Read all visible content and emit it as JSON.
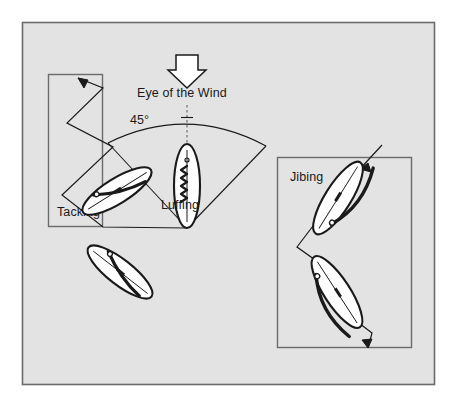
{
  "diagram": {
    "background_color": "#ffffff",
    "panel_fill": "#e3e3e3",
    "panel_border": "#6b6b6b",
    "ink_color": "#1a1a1a",
    "sail_fill": "#ffffff",
    "labels": {
      "eye_of_the_wind": "Eye of the Wind",
      "angle": "45°",
      "tacking": "Tacking",
      "luffing": "Luffing",
      "jibing": "Jibing"
    },
    "icons": {
      "wind_arrow": "down-arrow-icon",
      "no_go_zone": "wind-sector-icon",
      "tacking_track": "zigzag-path-icon",
      "jibing_track": "zigzag-path-icon"
    },
    "outer_frame": {
      "x": 22,
      "y": 22,
      "width": 413,
      "height": 363
    },
    "tacking_box": {
      "x": 48,
      "y": 74,
      "width": 55,
      "height": 153
    },
    "jibing_box": {
      "x": 277,
      "y": 157,
      "width": 135,
      "height": 191
    },
    "wind_sector": {
      "apex_x": 187,
      "apex_y": 228,
      "left_end_x": 108,
      "left_end_y": 143,
      "right_end_x": 266,
      "right_end_y": 146,
      "angle_degrees": 45
    },
    "boats": [
      {
        "name": "luffing-boat",
        "state": "luffing",
        "orientation": "vertical"
      },
      {
        "name": "tacking-boat-upper",
        "state": "port-tack",
        "orientation": "diagonal"
      },
      {
        "name": "tacking-boat-lower",
        "state": "starboard-tack",
        "orientation": "diagonal"
      },
      {
        "name": "jibing-boat-upper",
        "state": "broad-reach",
        "orientation": "diagonal"
      },
      {
        "name": "jibing-boat-lower",
        "state": "broad-reach",
        "orientation": "diagonal"
      }
    ]
  }
}
